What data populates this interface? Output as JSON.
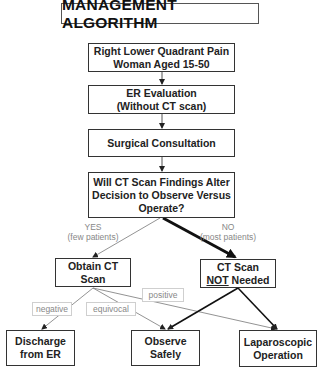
{
  "title": "MANAGEMENT ALGORITHM",
  "nodes": {
    "start": {
      "line1": "Right Lower Quadrant Pain",
      "line2": "Woman Aged 15-50"
    },
    "er_eval": {
      "line1": "ER Evaluation",
      "line2": "(Without CT scan)"
    },
    "surgical": {
      "line1": "Surgical Consultation"
    },
    "decision": {
      "line1": "Will CT Scan Findings Alter",
      "line2": "Decision to Observe Versus",
      "line3": "Operate?"
    },
    "obtain_ct": {
      "line1": "Obtain CT",
      "line2": "Scan"
    },
    "ct_not_needed": {
      "line1a": "CT Scan",
      "line2_underlined": "NOT",
      "line2_rest": " Needed"
    },
    "discharge": {
      "line1": "Discharge",
      "line2": "from ER"
    },
    "observe": {
      "line1": "Observe",
      "line2": "Safely"
    },
    "laparoscopic": {
      "line1": "Laparoscopic",
      "line2": "Operation"
    }
  },
  "branches": {
    "yes": {
      "label": "YES",
      "sub": "(few patients)"
    },
    "no": {
      "label": "NO",
      "sub": "(most patients)"
    }
  },
  "edge_labels": {
    "negative": "negative",
    "equivocal": "equivocal",
    "positive": "positive"
  },
  "colors": {
    "thin_edge": "#777777",
    "thick_edge": "#111111",
    "box_border": "#333333"
  }
}
